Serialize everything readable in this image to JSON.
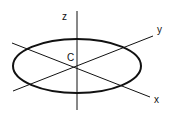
{
  "diagram": {
    "labels": {
      "z": "z",
      "y": "y",
      "x": "x",
      "center": "C"
    },
    "colors": {
      "stroke": "#111111",
      "background": "#ffffff"
    }
  }
}
